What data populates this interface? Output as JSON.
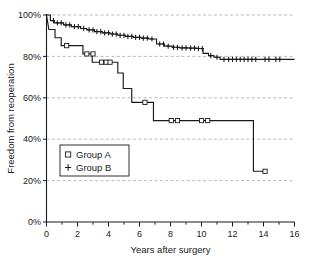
{
  "chart_data": {
    "type": "line",
    "title": "",
    "xlabel": "Years after surgery",
    "ylabel": "Freedom from reoperation",
    "xlim": [
      0,
      16
    ],
    "ylim": [
      0,
      100
    ],
    "grid": true,
    "grid_axis": "y",
    "legend_position": "center-left",
    "x_ticks": [
      0,
      2,
      4,
      6,
      8,
      10,
      12,
      14,
      16
    ],
    "x_tick_labels": [
      "0",
      "2",
      "4",
      "6",
      "8",
      "10",
      "12",
      "14",
      "16"
    ],
    "x_minor_ticks": [
      1,
      3,
      5,
      7,
      9,
      11,
      13,
      15
    ],
    "y_ticks": [
      0,
      20,
      40,
      60,
      80,
      100
    ],
    "y_tick_labels": [
      "0%",
      "20%",
      "40%",
      "60%",
      "80%",
      "100%"
    ],
    "series": [
      {
        "name": "Group A",
        "marker": "square",
        "style": "step-post",
        "x": [
          0,
          0.15,
          0.55,
          0.55,
          0.95,
          0.95,
          1.3,
          2.35,
          2.35,
          2.95,
          2.95,
          3.55,
          3.55,
          4.6,
          4.6,
          4.95,
          4.95,
          5.5,
          5.5,
          6.35,
          6.9,
          6.9,
          7.0,
          8.05,
          8.45,
          10.0,
          10.4,
          13.35,
          13.35,
          14.1
        ],
        "y": [
          100,
          93.0,
          93.0,
          89.0,
          89.0,
          85.2,
          85.2,
          85.2,
          81.2,
          81.2,
          77.2,
          77.2,
          77.2,
          77.2,
          72.0,
          72.0,
          64.5,
          64.5,
          57.8,
          57.8,
          57.8,
          49.0,
          49.0,
          49.0,
          49.0,
          49.0,
          49.0,
          49.0,
          24.5,
          24.5
        ],
        "censor_points": [
          {
            "x": 1.3,
            "y": 85.2
          },
          {
            "x": 2.6,
            "y": 81.2
          },
          {
            "x": 3.0,
            "y": 81.2
          },
          {
            "x": 3.55,
            "y": 77.2
          },
          {
            "x": 3.85,
            "y": 77.2
          },
          {
            "x": 4.1,
            "y": 77.2
          },
          {
            "x": 6.35,
            "y": 57.8
          },
          {
            "x": 8.05,
            "y": 49.0
          },
          {
            "x": 8.45,
            "y": 49.0
          },
          {
            "x": 10.0,
            "y": 49.0
          },
          {
            "x": 10.4,
            "y": 49.0
          },
          {
            "x": 14.1,
            "y": 24.5
          }
        ]
      },
      {
        "name": "Group B",
        "marker": "plus",
        "style": "step-post",
        "x": [
          0,
          0.25,
          0.25,
          0.5,
          0.5,
          1.1,
          1.1,
          1.6,
          1.6,
          2.2,
          2.2,
          2.6,
          2.6,
          3.1,
          3.1,
          3.6,
          3.6,
          4.1,
          4.1,
          4.6,
          4.6,
          5.1,
          5.1,
          5.6,
          5.6,
          6.1,
          6.1,
          6.6,
          6.6,
          7.1,
          7.1,
          7.6,
          7.6,
          8.1,
          8.1,
          8.6,
          8.6,
          9.2,
          9.2,
          9.7,
          9.7,
          10.1,
          10.1,
          10.45,
          10.45,
          10.8,
          10.8,
          11.2,
          11.2,
          16.0
        ],
        "y": [
          100,
          100,
          97.3,
          97.3,
          96.2,
          96.2,
          95.2,
          95.2,
          94.4,
          94.4,
          93.5,
          93.5,
          92.8,
          92.8,
          92.0,
          92.0,
          91.4,
          91.4,
          90.8,
          90.8,
          90.2,
          90.2,
          89.7,
          89.7,
          89.2,
          89.2,
          88.8,
          88.8,
          88.4,
          88.4,
          86.0,
          86.0,
          85.0,
          85.0,
          84.4,
          84.4,
          84.1,
          84.1,
          84.0,
          84.0,
          83.8,
          83.8,
          81.5,
          81.5,
          80.4,
          80.4,
          79.6,
          79.6,
          78.6,
          78.6
        ],
        "censor_points": [
          {
            "x": 0.45,
            "y": 97.3
          },
          {
            "x": 0.7,
            "y": 96.2
          },
          {
            "x": 0.95,
            "y": 96.2
          },
          {
            "x": 1.25,
            "y": 95.2
          },
          {
            "x": 1.5,
            "y": 95.2
          },
          {
            "x": 1.8,
            "y": 94.4
          },
          {
            "x": 2.05,
            "y": 94.4
          },
          {
            "x": 2.4,
            "y": 93.5
          },
          {
            "x": 2.75,
            "y": 92.8
          },
          {
            "x": 3.0,
            "y": 92.8
          },
          {
            "x": 3.25,
            "y": 92.0
          },
          {
            "x": 3.5,
            "y": 92.0
          },
          {
            "x": 3.75,
            "y": 91.4
          },
          {
            "x": 4.0,
            "y": 91.4
          },
          {
            "x": 4.25,
            "y": 90.8
          },
          {
            "x": 4.5,
            "y": 90.8
          },
          {
            "x": 4.75,
            "y": 90.2
          },
          {
            "x": 5.0,
            "y": 90.2
          },
          {
            "x": 5.25,
            "y": 89.7
          },
          {
            "x": 5.5,
            "y": 89.7
          },
          {
            "x": 5.75,
            "y": 89.2
          },
          {
            "x": 6.0,
            "y": 89.2
          },
          {
            "x": 6.25,
            "y": 88.8
          },
          {
            "x": 6.5,
            "y": 88.8
          },
          {
            "x": 6.8,
            "y": 88.4
          },
          {
            "x": 7.3,
            "y": 86.0
          },
          {
            "x": 7.55,
            "y": 86.0
          },
          {
            "x": 7.85,
            "y": 85.0
          },
          {
            "x": 8.2,
            "y": 84.4
          },
          {
            "x": 8.45,
            "y": 84.4
          },
          {
            "x": 8.75,
            "y": 84.1
          },
          {
            "x": 9.0,
            "y": 84.1
          },
          {
            "x": 9.3,
            "y": 84.0
          },
          {
            "x": 9.55,
            "y": 84.0
          },
          {
            "x": 9.8,
            "y": 83.8
          },
          {
            "x": 10.05,
            "y": 83.8
          },
          {
            "x": 10.6,
            "y": 80.4
          },
          {
            "x": 11.0,
            "y": 79.6
          },
          {
            "x": 11.45,
            "y": 78.6
          },
          {
            "x": 11.75,
            "y": 78.6
          },
          {
            "x": 12.0,
            "y": 78.6
          },
          {
            "x": 12.25,
            "y": 78.6
          },
          {
            "x": 12.5,
            "y": 78.6
          },
          {
            "x": 12.75,
            "y": 78.6
          },
          {
            "x": 13.0,
            "y": 78.6
          },
          {
            "x": 13.25,
            "y": 78.6
          },
          {
            "x": 13.5,
            "y": 78.6
          },
          {
            "x": 14.1,
            "y": 78.6
          },
          {
            "x": 14.35,
            "y": 78.6
          },
          {
            "x": 14.8,
            "y": 78.6
          },
          {
            "x": 15.05,
            "y": 78.6
          }
        ]
      }
    ],
    "legend": [
      {
        "label": "Group A",
        "marker": "square"
      },
      {
        "label": "Group B",
        "marker": "plus"
      }
    ],
    "colors": {
      "line": "#1a1a1a",
      "grid": "#aaaaaa",
      "background": "#ffffff"
    }
  }
}
